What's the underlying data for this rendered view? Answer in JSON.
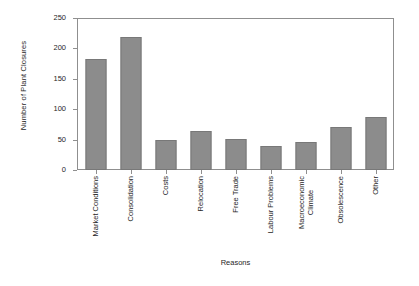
{
  "chart_data": {
    "type": "bar",
    "title": "",
    "xlabel": "Reasons",
    "ylabel": "Number of Plant Closures",
    "categories": [
      "Market Conditions",
      "Consolidation",
      "Costs",
      "Relocation",
      "Free Trade",
      "Labour Problems",
      "Macroeconomic\nClimate",
      "Obsolescence",
      "Other"
    ],
    "values": [
      184,
      220,
      49,
      64,
      51,
      39,
      46,
      72,
      88
    ],
    "ylim": [
      0,
      250
    ],
    "yticks": [
      0,
      50,
      100,
      150,
      200,
      250
    ],
    "ytick_labels": [
      "0",
      "50",
      "100",
      "150",
      "200",
      "250"
    ],
    "grid": false,
    "legend": false,
    "bar_color": "#8c8c8c",
    "bar_edge_color": "#787878",
    "axis_color": "#8f8f8f",
    "background": "#ffffff"
  }
}
